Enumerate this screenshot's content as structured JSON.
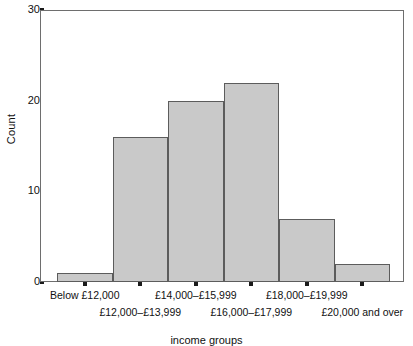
{
  "chart_data": {
    "type": "bar",
    "title": "",
    "subtitle": "",
    "xlabel": "income groups",
    "ylabel": "Count",
    "categories": [
      "Below £12,000",
      "£12,000–£13,999",
      "£14,000–£15,999",
      "£16,000–£17,999",
      "£18,000–£19,999",
      "£20,000 and over"
    ],
    "values": [
      1,
      16,
      20,
      22,
      7,
      2
    ],
    "ylim": [
      0,
      30
    ],
    "yticks": [
      0,
      10,
      20,
      30
    ],
    "ytick_labels": [
      "0",
      "10",
      "20",
      "30"
    ],
    "grid": false,
    "legend": false,
    "legend_position": "none",
    "bar_fill_color": "#c9c9c9",
    "bar_edge_color": "#5c5c5c",
    "axis_color": "#6e6e6e",
    "background_color": "#ffffff"
  }
}
